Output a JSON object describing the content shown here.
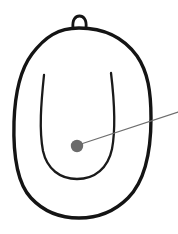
{
  "canvas": {
    "width": 178,
    "height": 234,
    "background_color": "#ffffff"
  },
  "figure": {
    "title": "",
    "style": "line-drawing",
    "shapes": [
      {
        "name": "outer-body-outline",
        "kind": "closed-curve",
        "stroke_color": "#141414",
        "stroke_width": 3.4,
        "fill": "none",
        "path": "M 79 28 C 104 28 124 38 137 56 C 148 72 151 92 151 118 C 151 152 145 181 128 198 C 113 213 96 218 79 218 C 62 218 45 213 31 198 C 17 183 13 156 14 122 C 15 92 20 70 32 54 C 45 37 58 28 79 28 Z"
      },
      {
        "name": "top-loop",
        "kind": "open-arc",
        "stroke_color": "#141414",
        "stroke_width": 2.8,
        "fill": "none",
        "path": "M 73 28 C 72 19 76 16 79.5 16 C 83 16 87 19 86 28"
      },
      {
        "name": "inner-u-curve",
        "kind": "open-curve",
        "stroke_color": "#1a1a1a",
        "stroke_width": 2.3,
        "fill": "none",
        "path": "M 44 75 C 41 104 39 130 43 151 C 47 169 60 179 77 179 C 95 179 108 168 112 149 C 116 128 114 98 111 73"
      }
    ],
    "annotation": {
      "name": "point-marker",
      "marker": {
        "shape": "circle",
        "cx": 77,
        "cy": 146,
        "r": 6.2,
        "fill_color": "#6b6b6b"
      },
      "leader_line": {
        "from_x": 78,
        "from_y": 145,
        "to_x": 178,
        "to_y": 112,
        "stroke_color": "#6e6e6e",
        "stroke_width": 1.3
      },
      "label_text": ""
    }
  }
}
